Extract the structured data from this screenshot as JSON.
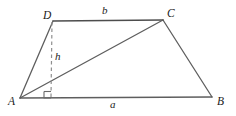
{
  "figure": {
    "type": "geometry-diagram",
    "shape": "trapezoid",
    "background_color": "#ffffff",
    "stroke_color": "#555555",
    "dash_color": "#8a8a8a",
    "text_color": "#1b1b1b",
    "labels": {
      "vertex_a": "A",
      "vertex_b": "B",
      "vertex_c": "C",
      "vertex_d": "D",
      "side_a": "a",
      "side_b": "b",
      "height": "h"
    },
    "vertices": {
      "A": {
        "x": 20,
        "y": 98
      },
      "B": {
        "x": 212,
        "y": 97
      },
      "C": {
        "x": 163,
        "y": 20
      },
      "D": {
        "x": 53,
        "y": 21
      }
    },
    "segments": [
      {
        "name": "side-AB",
        "from": "A",
        "to": "B",
        "style": "solid"
      },
      {
        "name": "side-BC",
        "from": "B",
        "to": "C",
        "style": "solid"
      },
      {
        "name": "side-CD",
        "from": "C",
        "to": "D",
        "style": "solid"
      },
      {
        "name": "side-DA",
        "from": "D",
        "to": "A",
        "style": "solid"
      },
      {
        "name": "diagonal-AC",
        "from": "A",
        "to": "C",
        "style": "solid"
      },
      {
        "name": "height-line",
        "from": "D",
        "to": "foot",
        "style": "dashed"
      }
    ],
    "height_foot": {
      "x": 51,
      "y": 98
    },
    "right_angle_marker": {
      "x": 44,
      "y": 91,
      "size": 7
    }
  }
}
